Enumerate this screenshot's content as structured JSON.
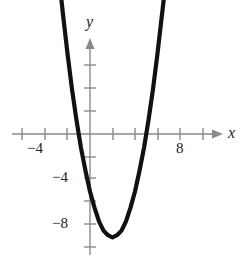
{
  "figure": {
    "background_color": "#ffffff",
    "axis_color": "#8a8a8a",
    "curve_color": "#111111"
  },
  "axis_names": {
    "x": "x",
    "y": "y"
  },
  "tick_labels": {
    "x_neg4": "−4",
    "x_8": "8",
    "y_neg4": "−4",
    "y_neg8": "−8"
  },
  "chart_data": {
    "type": "line",
    "title": "",
    "xlabel": "x",
    "ylabel": "y",
    "grid": false,
    "legend": "none",
    "xlim": [
      -6.1,
      11.1
    ],
    "ylim": [
      -11.3,
      8.0
    ],
    "x_ticks": [
      -6,
      -4,
      -2,
      0,
      2,
      4,
      6,
      8,
      10
    ],
    "x_tick_labels": [
      "",
      "−4",
      "",
      "",
      "",
      "",
      "",
      "8",
      ""
    ],
    "y_ticks": [
      -10,
      -8,
      -6,
      -4,
      -2,
      2,
      4,
      6
    ],
    "y_tick_labels": [
      "",
      "−8",
      "",
      "−4",
      "",
      "",
      "",
      ""
    ],
    "series": [
      {
        "name": "parabola",
        "equation": "y = x^2 - 4x - 5",
        "vertex": [
          2,
          -9
        ],
        "x_intercepts": [
          -1,
          5
        ],
        "y_intercept": -5,
        "x": [
          -2.7,
          -2.4,
          -2.0,
          -1.6,
          -1.2,
          -0.8,
          -0.4,
          0.0,
          0.4,
          0.8,
          1.2,
          1.6,
          2.0,
          2.4,
          2.8,
          3.2,
          3.6,
          4.0,
          4.4,
          4.8,
          5.2,
          5.6,
          6.0,
          6.4,
          6.7
        ],
        "y": [
          13.1,
          10.4,
          7.0,
          3.9,
          1.2,
          -1.2,
          -3.2,
          -5.0,
          -6.4,
          -7.6,
          -8.4,
          -8.8,
          -9.0,
          -8.8,
          -8.4,
          -7.6,
          -6.4,
          -5.0,
          -3.2,
          -1.2,
          1.2,
          3.9,
          7.0,
          10.4,
          12.9
        ]
      }
    ]
  }
}
